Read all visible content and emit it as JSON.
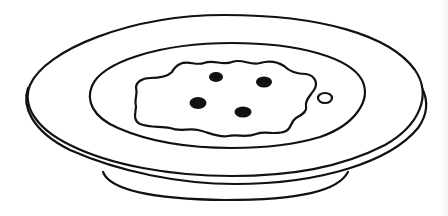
{
  "illustration": {
    "subject": "plate with food",
    "description": "Black-and-white line drawing of a shallow plate with a wavy-edged portion of food containing four dark spots and one small ring beside it",
    "colors": {
      "background": "#ffffff",
      "ink": "#111111"
    },
    "parts": [
      {
        "name": "plate-rim",
        "label": "Plate rim"
      },
      {
        "name": "plate-well",
        "label": "Plate well"
      },
      {
        "name": "plate-foot",
        "label": "Plate foot"
      },
      {
        "name": "food-portion",
        "label": "Food portion"
      },
      {
        "name": "food-spots",
        "label": "Dark spots",
        "count": 4
      },
      {
        "name": "small-ring",
        "label": "Small ring",
        "count": 1
      }
    ]
  }
}
